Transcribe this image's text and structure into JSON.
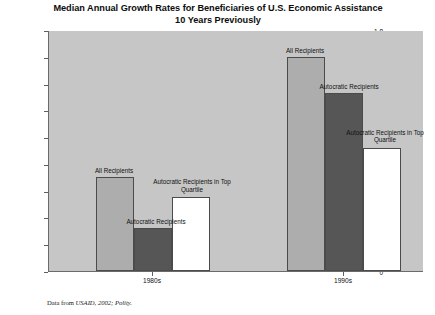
{
  "chart_data": {
    "type": "bar",
    "title_line1": "Median Annual Growth Rates for Beneficiaries of U.S. Economic Assistance",
    "title_line2": "10 Years Previously",
    "xlabel": "",
    "ylabel": "Annual Annual Growth (GDP/Capita)",
    "categories": [
      "1980s",
      "1990s"
    ],
    "ylim": [
      0,
      1.8
    ],
    "ytick_labels": [
      "0",
      "0.2",
      "0.4",
      "0.6",
      "0.8",
      "1",
      "1.2",
      "1.4",
      "1.6",
      "1.8"
    ],
    "ytick_values": [
      0,
      0.2,
      0.4,
      0.6,
      0.8,
      1.0,
      1.2,
      1.4,
      1.6,
      1.8
    ],
    "grid": false,
    "legend_position": "inline-labels",
    "series": [
      {
        "name": "All Recipients",
        "color": "#adadad",
        "values": [
          0.7,
          1.6
        ]
      },
      {
        "name": "Autocratic Recipients",
        "color": "#565656",
        "values": [
          0.32,
          1.33
        ]
      },
      {
        "name": "Autocratic Recipients in Top Quartile",
        "color": "#ffffff",
        "values": [
          0.55,
          0.92
        ]
      }
    ],
    "annotations": [
      {
        "text": "All Recipients",
        "group": "1980s",
        "series": "All Recipients"
      },
      {
        "text": "Autocratic Recipients",
        "group": "1980s",
        "series": "Autocratic Recipients"
      },
      {
        "text": "Autocratic Recipients in Top\nQuartile",
        "group": "1980s",
        "series": "Autocratic Recipients in Top Quartile"
      },
      {
        "text": "All Recipients",
        "group": "1990s",
        "series": "All Recipients"
      },
      {
        "text": "Autocratic Recipients",
        "group": "1990s",
        "series": "Autocratic Recipients"
      },
      {
        "text": "Autocratic Recipients in Top\nQuartile",
        "group": "1990s",
        "series": "Autocratic Recipients in Top Quartile"
      }
    ],
    "source_note_prefix": "Data from ",
    "source_note_emphasis": "USAID, 2002; Polity.",
    "plot_background": "#c6c6c6",
    "axis_color": "#6b6b6b"
  }
}
